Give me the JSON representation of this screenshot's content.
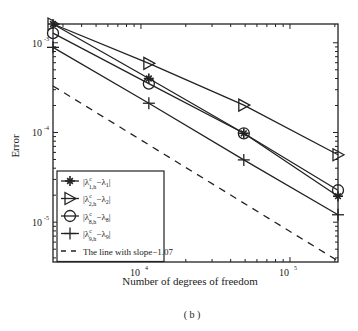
{
  "chart_data": {
    "type": "line",
    "title": "",
    "xlabel": "Number of degrees of freedom",
    "ylabel": "Error",
    "caption": "( b )",
    "xscale": "log",
    "yscale": "log",
    "xlim": [
      2570,
      210000
    ],
    "ylim": [
      3.6e-06,
      0.00162
    ],
    "xticks": [
      {
        "value": 10000,
        "base": "10",
        "exp": "4"
      },
      {
        "value": 100000,
        "base": "10",
        "exp": "5"
      }
    ],
    "yticks": [
      {
        "value": 0.001,
        "base": "10",
        "exp": "-3"
      },
      {
        "value": 0.0001,
        "base": "10",
        "exp": "-4"
      },
      {
        "value": 1e-05,
        "base": "10",
        "exp": "-5"
      }
    ],
    "legend_position": "bottom-left",
    "series": [
      {
        "name": "|λ^c_{1,h} − λ_1|",
        "label_main": "|λ",
        "sup": "c",
        "sub": "1,h",
        "tail": "−λ",
        "tail_sub": "1",
        "tail_end": "|",
        "marker": "star",
        "x": [
          2570,
          11300,
          49000,
          210000
        ],
        "y": [
          0.00162,
          0.0004,
          9.8e-05,
          1.95e-05
        ]
      },
      {
        "name": "|λ^c_{2,h} − λ_2|",
        "label_main": "|λ",
        "sup": "c",
        "sub": "2,h",
        "tail": "−λ",
        "tail_sub": "2",
        "tail_end": "|",
        "marker": "triangle",
        "x": [
          2570,
          11300,
          49000,
          210000
        ],
        "y": [
          0.00162,
          0.00059,
          0.000202,
          5.65e-05
        ]
      },
      {
        "name": "|λ^c_{8,h} − λ_8|",
        "label_main": "|λ",
        "sup": "c",
        "sub": "8,h",
        "tail": "−λ",
        "tail_sub": "8",
        "tail_end": "|",
        "marker": "circle",
        "x": [
          2570,
          11300,
          49000,
          210000
        ],
        "y": [
          0.00128,
          0.00035,
          9.8e-05,
          2.27e-05
        ]
      },
      {
        "name": "|λ^c_{9,h} − λ_9|",
        "label_main": "|λ",
        "sup": "c",
        "sub": "9,h",
        "tail": "−λ",
        "tail_sub": "9",
        "tail_end": "|",
        "marker": "plus",
        "x": [
          2570,
          11300,
          49000,
          210000
        ],
        "y": [
          0.00089,
          0.000212,
          4.95e-05,
          1.21e-05
        ]
      },
      {
        "name": "The line with slope−1.07",
        "label_plain": "The line with slope−1.07",
        "marker": "none",
        "dashed": true,
        "x": [
          2570,
          210000
        ],
        "y": [
          0.00033,
          3.7e-06
        ]
      }
    ]
  }
}
